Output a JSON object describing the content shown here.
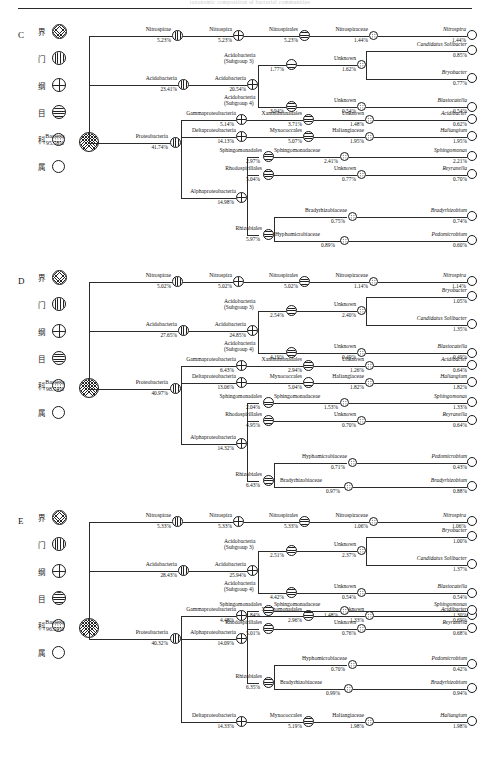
{
  "figure": {
    "top_caption_ghost": "taxonomic composition of bacterial communities",
    "panels": [
      "C",
      "D",
      "E"
    ]
  },
  "legend": {
    "ranks": [
      {
        "cn": "界",
        "en": "kingdom",
        "glyph": "kingdom-node-icon"
      },
      {
        "cn": "门",
        "en": "phylum",
        "glyph": "phylum-node-icon"
      },
      {
        "cn": "纲",
        "en": "class",
        "glyph": "class-node-icon"
      },
      {
        "cn": "目",
        "en": "order",
        "glyph": "order-node-icon"
      },
      {
        "cn": "科",
        "en": "family",
        "glyph": "family-node-icon"
      },
      {
        "cn": "属",
        "en": "genus",
        "glyph": "genus-node-icon"
      }
    ]
  },
  "panelC": {
    "letter": "C",
    "root": {
      "name": "Bacteria",
      "pct": "95.78%"
    },
    "nitrospirae": {
      "phylum": "Nitrospirae",
      "phylum_pct": "5.23%",
      "class": "Nitrospira",
      "class_pct": "5.23%",
      "order": "Nitrospirales",
      "order_pct": "5.23%",
      "family": "Nitrospiraceae",
      "family_pct": "1.44%",
      "genus": "Nitrospira",
      "genus_pct": "1.44%"
    },
    "acido": {
      "phylum": "Acidobacteria",
      "phylum_pct": "23.41%",
      "class": "Acidobacteria",
      "class_pct": "20.54%",
      "sg3": {
        "order_l1": "Acidobacteria",
        "order_l2": "(Subgroup 3)",
        "order_pct": "1.77%",
        "family": "Unknown",
        "family_pct": "1.62%",
        "genera": [
          {
            "name": "Candidatus Solibacter",
            "pct": "0.85%"
          },
          {
            "name": "Bryobacter",
            "pct": "0.77%"
          }
        ]
      },
      "sg4": {
        "order_l1": "Acidobacteria",
        "order_l2": "(Subgroup 4)",
        "order_pct": "3.94%",
        "family": "Unknown",
        "family_pct": "0.54%",
        "genus": "Blastocatella",
        "genus_pct": "0.54%"
      }
    },
    "proteo": {
      "phylum": "Proteobacteria",
      "phylum_pct": "41.74%",
      "gamma": {
        "class": "Gammaproteobacteria",
        "class_pct": "5.14%",
        "order": "Xanthomonadales",
        "order_pct": "3.71%",
        "family": "Unknown",
        "family_pct": "1.48%",
        "genus": "Acidibacter",
        "genus_pct": "0.62%"
      },
      "delta": {
        "class": "Deltaproteobacteria",
        "class_pct": "14.13%",
        "order": "Myxococcales",
        "order_pct": "5.07%",
        "family": "Haliangiaceae",
        "family_pct": "1.95%",
        "genus": "Haliangium",
        "genus_pct": "1.95%"
      },
      "alpha": {
        "class": "Alphaproteobacteria",
        "class_pct": "14.98%",
        "orders": [
          {
            "order": "Sphingomonadales",
            "order_pct": "2.97%",
            "family": "Sphingomonadaceae",
            "family_pct": "2.41%",
            "genus": "Sphingomonas",
            "genus_pct": "2.21%"
          },
          {
            "order": "Rhodospirillales",
            "order_pct": "5.04%",
            "family": "Unknown",
            "family_pct": "0.77%",
            "genus": "Reyranella",
            "genus_pct": "0.70%"
          }
        ],
        "rhizobiales": {
          "order": "Rhizobiales",
          "order_pct": "5.97%",
          "families": [
            {
              "family": "Bradyrhizobiaceae",
              "family_pct": "0.75%",
              "genus": "Bradyrhizobium",
              "genus_pct": "0.74%"
            },
            {
              "family": "Hyphomicrobiaceae",
              "family_pct": "0.89%",
              "genus": "Pedomicrobium",
              "genus_pct": "0.60%"
            }
          ]
        }
      }
    }
  },
  "panelD": {
    "letter": "D",
    "root": {
      "name": "Bacteria",
      "pct": "98.74%"
    },
    "nitrospirae": {
      "phylum": "Nitrospirae",
      "phylum_pct": "5.02%",
      "class": "Nitrospira",
      "class_pct": "5.02%",
      "order": "Nitrospirales",
      "order_pct": "5.02%",
      "family": "Nitrospiraceae",
      "family_pct": "1.14%",
      "genus": "Nitrospira",
      "genus_pct": "1.14%"
    },
    "acido": {
      "phylum": "Acidobacteria",
      "phylum_pct": "27.65%",
      "class": "Acidobacteria",
      "class_pct": "24.85%",
      "sg3": {
        "order_l1": "Acidobacteria",
        "order_l2": "(Subgroup 3)",
        "order_pct": "2.54%",
        "family": "Unknown",
        "family_pct": "2.40%",
        "genera": [
          {
            "name": "Bryobacter",
            "pct": "1.05%"
          },
          {
            "name": "Candidatus Solibacter",
            "pct": "1.35%"
          }
        ]
      },
      "sg4": {
        "order_l1": "Acidobacteria",
        "order_l2": "(Subgroup 4)",
        "order_pct": "4.19%",
        "family": "Unknown",
        "family_pct": "0.49%",
        "genus": "Blastocatella",
        "genus_pct": "0.49%"
      }
    },
    "proteo": {
      "phylum": "Proteobacteria",
      "phylum_pct": "40.97%",
      "gamma": {
        "class": "Gammaproteobacteria",
        "class_pct": "6.43%",
        "order": "Xanthomonadales",
        "order_pct": "2.94%",
        "family": "Unknown",
        "family_pct": "1.26%",
        "genus": "Acidibacter",
        "genus_pct": "0.64%"
      },
      "delta": {
        "class": "Deltaproteobacteria",
        "class_pct": "13.06%",
        "order": "Myxococcales",
        "order_pct": "5.04%",
        "family": "Haliangiaceae",
        "family_pct": "1.82%",
        "genus": "Haliangium",
        "genus_pct": "1.82%"
      },
      "alpha": {
        "class": "Alphaproteobacteria",
        "class_pct": "14.32%",
        "orders": [
          {
            "order": "Sphingomonadales",
            "order_pct": "2.04%",
            "family": "Sphingomonadaceae",
            "family_pct": "1.53%",
            "genus": "Sphingomonas",
            "genus_pct": "1.33%"
          },
          {
            "order": "Rhodospirillales",
            "order_pct": "4.95%",
            "family": "Unknown",
            "family_pct": "0.70%",
            "genus": "Reyranella",
            "genus_pct": "0.64%"
          }
        ],
        "rhizobiales": {
          "order": "Rhizobiales",
          "order_pct": "6.43%",
          "families": [
            {
              "family": "Hyphomicrobiaceae",
              "family_pct": "0.71%",
              "genus": "Pedomicrobium",
              "genus_pct": "0.43%"
            },
            {
              "family": "Bradyrhizobiaceae",
              "family_pct": "0.97%",
              "genus": "Bradyrhizobium",
              "genus_pct": "0.88%"
            }
          ]
        }
      }
    }
  },
  "panelE": {
    "letter": "E",
    "root": {
      "name": "Bacteria",
      "pct": "96.59%"
    },
    "nitrospirae": {
      "phylum": "Nitrospirae",
      "phylum_pct": "5.33%",
      "class": "Nitrospira",
      "class_pct": "5.33%",
      "order": "Nitrospirales",
      "order_pct": "5.33%",
      "family": "Nitrospiraceae",
      "family_pct": "1.06%",
      "genus": "Nitrospira",
      "genus_pct": "1.06%"
    },
    "acido": {
      "phylum": "Acidobacteria",
      "phylum_pct": "28.43%",
      "class": "Acidobacteria",
      "class_pct": "25.94%",
      "sg3": {
        "order_l1": "Acidobacteria",
        "order_l2": "(Subgroup 3)",
        "order_pct": "2.51%",
        "family": "Unknown",
        "family_pct": "2.37%",
        "genera": [
          {
            "name": "Bryobacter",
            "pct": "1.00%"
          },
          {
            "name": "Candidatus Solibacter",
            "pct": "1.37%"
          }
        ]
      },
      "sg4": {
        "order_l1": "Acidobacteria",
        "order_l2": "(Subgroup 4)",
        "order_pct": "4.42%",
        "family": "Unknown",
        "family_pct": "0.54%",
        "genus": "Blastocatella",
        "genus_pct": "0.54%"
      }
    },
    "proteo": {
      "phylum": "Proteobacteria",
      "phylum_pct": "40.32%",
      "gamma": {
        "class": "Gammaproteobacteria",
        "class_pct": "4.48%",
        "order": "Xanthomonadales",
        "order_pct": "2.96%",
        "family": "Unknown",
        "family_pct": "1.33%",
        "genus": "Acidibacter",
        "genus_pct": "0.69%"
      },
      "alpha": {
        "class": "Alphaproteobacteria",
        "class_pct": "14.09%",
        "orders": [
          {
            "order": "Sphingomonadales",
            "order_pct": "1.84%",
            "family": "Sphingomonadaceae",
            "family_pct": "1.48%",
            "genus": "Sphingomonas",
            "genus_pct": "1.30%"
          },
          {
            "order": "Rhodospirillales",
            "order_pct": "5.01%",
            "family": "Unknown",
            "family_pct": "0.76%",
            "genus": "Reyranella",
            "genus_pct": "0.68%"
          }
        ],
        "rhizobiales": {
          "order": "Rhizobiales",
          "order_pct": "6.35%",
          "families": [
            {
              "family": "Hyphomicrobiaceae",
              "family_pct": "0.70%",
              "genus": "Pedomicrobium",
              "genus_pct": "0.42%"
            },
            {
              "family": "Bradyrhizobiaceae",
              "family_pct": "0.99%",
              "genus": "Bradyrhizobium",
              "genus_pct": "0.94%"
            }
          ]
        }
      },
      "delta": {
        "class": "Deltaproteobacteria",
        "class_pct": "14.33%",
        "order": "Myxococcales",
        "order_pct": "5.19%",
        "family": "Haliangiaceae",
        "family_pct": "1.98%",
        "genus": "Haliangium",
        "genus_pct": "1.98%"
      }
    }
  }
}
